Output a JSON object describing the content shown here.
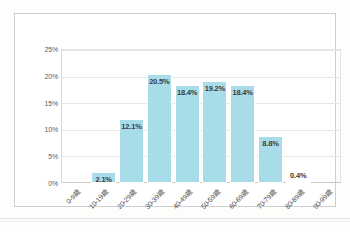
{
  "chart_data": {
    "type": "bar",
    "title": "",
    "subtitle": "",
    "xlabel": "",
    "ylabel": "",
    "categories": [
      "0-9歳",
      "10-19歳",
      "20-29歳",
      "30-39歳",
      "40-49歳",
      "50-59歳",
      "60-69歳",
      "70-79歳",
      "80-89歳",
      "90-99歳"
    ],
    "values": [
      0,
      2.1,
      12.1,
      20.5,
      18.4,
      19.2,
      18.4,
      8.8,
      0.4,
      0
    ],
    "data_labels": [
      "",
      "2.1%",
      "12.1%",
      "20.5%",
      "18.4%",
      "19.2%",
      "18.4%",
      "8.8%",
      "0.4%",
      ""
    ],
    "label_position": [
      "none",
      "inside",
      "inside",
      "inside",
      "inside",
      "inside",
      "inside",
      "inside",
      "outside",
      "none"
    ],
    "ylim": [
      0,
      25
    ],
    "ytick_values": [
      0,
      5,
      10,
      15,
      20,
      25
    ],
    "ytick_labels": [
      "0%",
      "5%",
      "10%",
      "15%",
      "20%",
      "25%"
    ],
    "grid": true,
    "grid_axis": "y",
    "legend": false,
    "legend_position": "none",
    "bar_color": "#a9dce9",
    "gridline_color": "#e6e6e6",
    "label_text_color": "#3a3a3a",
    "axis_text_color": "#4a4a4a",
    "plot_background": "#ffffff"
  }
}
